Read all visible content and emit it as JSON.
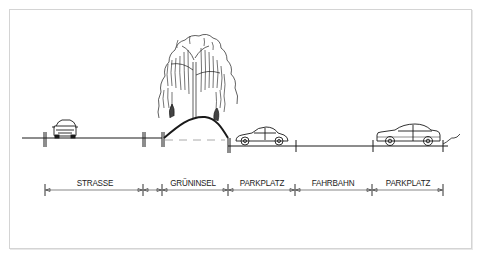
{
  "drawing": {
    "title": "Street cross-section",
    "labels": [
      "STRASSE",
      "GRÜNINSEL",
      "PARKPLATZ",
      "FAHRBAHN",
      "PARKPLATZ"
    ],
    "segments": [
      {
        "name": "strasse",
        "label": "STRASSE",
        "x_start": 45,
        "x_end": 143
      },
      {
        "name": "gap-1",
        "label": "",
        "x_start": 143,
        "x_end": 162
      },
      {
        "name": "gruninsel",
        "label": "GRÜNINSEL",
        "x_start": 162,
        "x_end": 228
      },
      {
        "name": "parkplatz-1",
        "label": "PARKPLATZ",
        "x_start": 228,
        "x_end": 295
      },
      {
        "name": "fahrbahn",
        "label": "FAHRBAHN",
        "x_start": 295,
        "x_end": 372
      },
      {
        "name": "parkplatz-2",
        "label": "PARKPLATZ",
        "x_start": 372,
        "x_end": 443
      }
    ],
    "elements": [
      "car-front-view",
      "birch-tree",
      "car-side-view-porsche",
      "car-side-view-coupe"
    ],
    "line_color": "#1a1a1a",
    "frame_color": "#d4d4d4"
  }
}
